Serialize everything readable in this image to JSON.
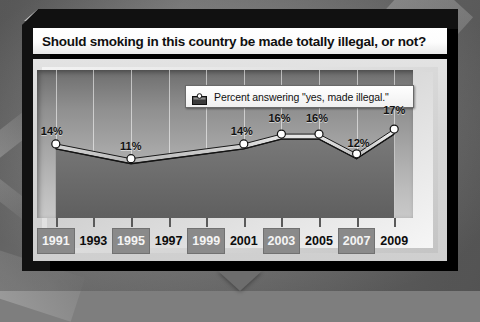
{
  "title": "Should smoking in this country be made totally illegal, or not?",
  "legend": {
    "label": "Percent answering \"yes, made illegal.\"",
    "swatch_icon": "area-series-swatch-icon"
  },
  "colors": {
    "panel_border": "#111111",
    "title_bg": "#ffffff",
    "plot_top": "#6e6e6e",
    "plot_bottom": "#c9c9c9",
    "area_fill": "#6a6a6a",
    "line": "#111111",
    "marker": "#ffffff",
    "year_box": "#8a8a8a",
    "gridline": "#ffffff"
  },
  "chart_data": {
    "type": "line",
    "title": "Should smoking in this country be made totally illegal, or not?",
    "subtitle": "",
    "xlabel": "",
    "ylabel": "",
    "ylim": [
      0,
      30
    ],
    "grid": "vertical",
    "legend_position": "top-right-inside",
    "tick_labels": [
      "1991",
      "1993",
      "1995",
      "1997",
      "1999",
      "2001",
      "2003",
      "2005",
      "2007",
      "2009"
    ],
    "highlighted_ticks": [
      "1991",
      "1995",
      "1999",
      "2003",
      "2007"
    ],
    "series": [
      {
        "name": "Percent answering \"yes, made illegal.\"",
        "x": [
          1991,
          1995,
          2001,
          2003,
          2005,
          2007,
          2009
        ],
        "values": [
          14,
          11,
          14,
          16,
          16,
          12,
          17
        ],
        "data_labels": [
          "14%",
          "11%",
          "14%",
          "16%",
          "16%",
          "12%",
          "17%"
        ]
      }
    ]
  }
}
